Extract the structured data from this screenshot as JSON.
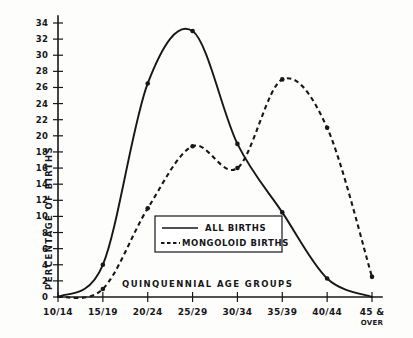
{
  "chart_data": {
    "type": "line",
    "title": "",
    "xlabel": "QUINQUENNIAL AGE GROUPS",
    "ylabel": "PERCENTAGE OF BIRTHS",
    "categories": [
      "10/14",
      "15/19",
      "20/24",
      "25/29",
      "30/34",
      "35/39",
      "40/44",
      "45 & OVER"
    ],
    "ylim": [
      0,
      34
    ],
    "yticks": [
      0,
      2,
      4,
      6,
      8,
      10,
      12,
      14,
      16,
      18,
      20,
      22,
      24,
      26,
      28,
      30,
      32,
      34
    ],
    "grid": false,
    "legend_position": "center",
    "series": [
      {
        "name": "ALL BIRTHS",
        "style": "solid",
        "values": [
          0.0,
          4.0,
          26.5,
          33.0,
          19.0,
          10.5,
          2.3,
          0.0
        ]
      },
      {
        "name": "MONGOLOID BIRTHS",
        "style": "dashed",
        "values": [
          0.0,
          1.0,
          11.0,
          18.7,
          16.0,
          27.0,
          21.0,
          2.5
        ]
      }
    ]
  },
  "axes": {
    "y_tick_labels": [
      "0",
      "2",
      "4",
      "6",
      "8",
      "10",
      "12",
      "14",
      "16",
      "18",
      "20",
      "22",
      "24",
      "26",
      "28",
      "30",
      "32",
      "34"
    ],
    "x_tick_labels": [
      "10/14",
      "15/19",
      "20/24",
      "25/29",
      "30/34",
      "35/39",
      "40/44",
      "45 &"
    ],
    "x_last_tick_sub": "OVER",
    "y_axis_title": "PERCENTAGE OF BIRTHS",
    "x_axis_title": "QUINQUENNIAL AGE GROUPS"
  },
  "legend": {
    "entries": [
      {
        "label": "ALL  BIRTHS",
        "style": "solid"
      },
      {
        "label": "MONGOLOID BIRTHS",
        "style": "dashed"
      }
    ]
  }
}
